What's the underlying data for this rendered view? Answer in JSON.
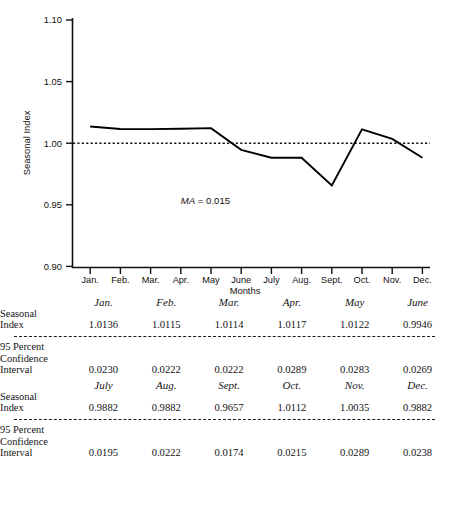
{
  "chart_data": {
    "type": "line",
    "title": "",
    "xlabel": "Months",
    "ylabel": "Seasonal Index",
    "categories": [
      "Jan.",
      "Feb.",
      "Mar.",
      "Apr.",
      "May",
      "June",
      "July",
      "Aug.",
      "Sept.",
      "Oct.",
      "Nov.",
      "Dec."
    ],
    "series": [
      {
        "name": "Seasonal Index",
        "style": "solid",
        "values": [
          1.0136,
          1.0115,
          1.0114,
          1.0117,
          1.0122,
          0.9946,
          0.9882,
          0.9882,
          0.9657,
          1.0112,
          1.0035,
          0.9882
        ]
      },
      {
        "name": "Reference line at 1.00",
        "style": "dotted",
        "values": [
          1.0,
          1.0,
          1.0,
          1.0,
          1.0,
          1.0,
          1.0,
          1.0,
          1.0,
          1.0,
          1.0,
          1.0
        ]
      }
    ],
    "ylim": [
      0.9,
      1.1
    ],
    "yticks": [
      "0.90",
      "0.95",
      "1.00",
      "1.05",
      "1.10"
    ],
    "ytick_values": [
      0.9,
      0.95,
      1.0,
      1.05,
      1.1
    ],
    "grid": false,
    "legend": "none",
    "annotations": [
      {
        "label_italic": "MA",
        "label_rest": " = 0.015",
        "x_value": 3.0,
        "y_value": 0.951
      }
    ]
  },
  "axes": {
    "y_label": "Seasonal Index",
    "x_label": "Months",
    "y_ticks": [
      "1.10",
      "1.05",
      "1.00",
      "0.95",
      "0.90"
    ],
    "x_ticks": [
      "Jan.",
      "Feb.",
      "Mar.",
      "Apr.",
      "May",
      "June",
      "July",
      "Aug.",
      "Sept.",
      "Oct.",
      "Nov.",
      "Dec."
    ]
  },
  "annotation": {
    "ma_italic": "MA",
    "ma_value": " = 0.015"
  },
  "tables": [
    {
      "headers": [
        "Jan.",
        "Feb.",
        "Mar.",
        "Apr.",
        "May",
        "June"
      ],
      "rows": [
        {
          "label": "Seasonal\nIndex",
          "values": [
            "1.0136",
            "1.0115",
            "1.0114",
            "1.0117",
            "1.0122",
            "0.9946"
          ]
        },
        {
          "label": "95 Percent\nConfidence\nInterval",
          "values": [
            "0.0230",
            "0.0222",
            "0.0222",
            "0.0289",
            "0.0283",
            "0.0269"
          ]
        }
      ]
    },
    {
      "headers": [
        "July",
        "Aug.",
        "Sept.",
        "Oct.",
        "Nov.",
        "Dec."
      ],
      "rows": [
        {
          "label": "Seasonal\nIndex",
          "values": [
            "0.9882",
            "0.9882",
            "0.9657",
            "1.0112",
            "1.0035",
            "0.9882"
          ]
        },
        {
          "label": "95 Percent\nConfidence\nInterval",
          "values": [
            "0.0195",
            "0.0222",
            "0.0174",
            "0.0215",
            "0.0289",
            "0.0238"
          ]
        }
      ]
    }
  ],
  "caption": {
    "text": ""
  },
  "colors": {
    "ink": "#111111",
    "background": "#ffffff"
  }
}
